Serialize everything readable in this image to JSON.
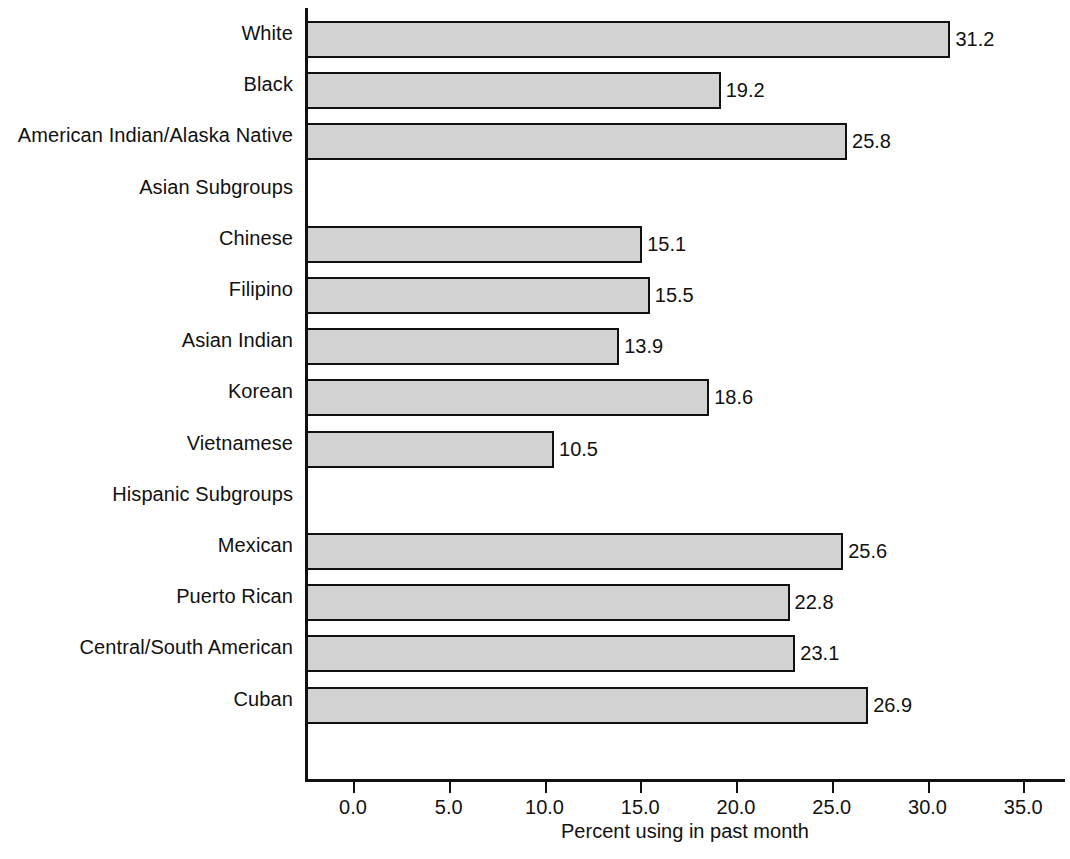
{
  "chart_data": {
    "type": "bar",
    "orientation": "horizontal",
    "title": "",
    "xlabel": "Percent using in past month",
    "ylabel": "",
    "xlim": [
      0.0,
      35.0
    ],
    "xticks": [
      "0.0",
      "5.0",
      "10.0",
      "15.0",
      "20.0",
      "25.0",
      "30.0",
      "35.0"
    ],
    "xtick_values": [
      0.0,
      5.0,
      10.0,
      15.0,
      20.0,
      25.0,
      30.0,
      35.0
    ],
    "grid": false,
    "legend": false,
    "bar_fill_color": "#d2d2d2",
    "bar_border_color": "#111111",
    "axis_color": "#111111",
    "categories": [
      "White",
      "Black",
      "American Indian/Alaska Native",
      "Asian Subgroups",
      "Chinese",
      "Filipino",
      "Asian Indian",
      "Korean",
      "Vietnamese",
      "Hispanic Subgroups",
      "Mexican",
      "Puerto Rican",
      "Central/South American",
      "Cuban"
    ],
    "values": [
      31.2,
      19.2,
      25.8,
      null,
      15.1,
      15.5,
      13.9,
      18.6,
      10.5,
      null,
      25.6,
      22.8,
      23.1,
      26.9
    ],
    "rows": [
      {
        "label": "White",
        "value": 31.2,
        "value_label": "31.2",
        "is_header": false
      },
      {
        "label": "Black",
        "value": 19.2,
        "value_label": "19.2",
        "is_header": false
      },
      {
        "label": "American Indian/Alaska Native",
        "value": 25.8,
        "value_label": "25.8",
        "is_header": false
      },
      {
        "label": "Asian Subgroups",
        "value": null,
        "value_label": "",
        "is_header": true
      },
      {
        "label": "Chinese",
        "value": 15.1,
        "value_label": "15.1",
        "is_header": false
      },
      {
        "label": "Filipino",
        "value": 15.5,
        "value_label": "15.5",
        "is_header": false
      },
      {
        "label": "Asian Indian",
        "value": 13.9,
        "value_label": "13.9",
        "is_header": false
      },
      {
        "label": "Korean",
        "value": 18.6,
        "value_label": "18.6",
        "is_header": false
      },
      {
        "label": "Vietnamese",
        "value": 10.5,
        "value_label": "10.5",
        "is_header": false
      },
      {
        "label": "Hispanic Subgroups",
        "value": null,
        "value_label": "",
        "is_header": true
      },
      {
        "label": "Mexican",
        "value": 25.6,
        "value_label": "25.6",
        "is_header": false
      },
      {
        "label": "Puerto Rican",
        "value": 22.8,
        "value_label": "22.8",
        "is_header": false
      },
      {
        "label": "Central/South American",
        "value": 23.1,
        "value_label": "23.1",
        "is_header": false
      },
      {
        "label": "Cuban",
        "value": 26.9,
        "value_label": "26.9",
        "is_header": false
      }
    ]
  }
}
